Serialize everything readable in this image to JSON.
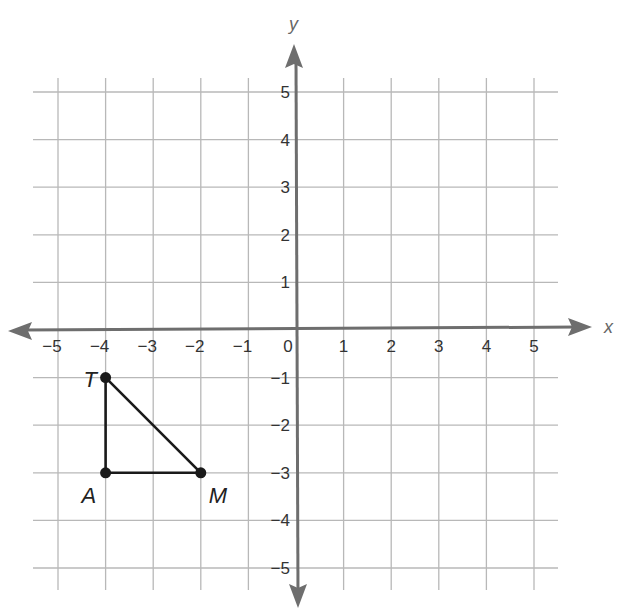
{
  "chart_data": {
    "type": "scatter",
    "title": "",
    "xlabel": "x",
    "ylabel": "y",
    "xlim": [
      -5,
      5
    ],
    "ylim": [
      -5,
      5
    ],
    "grid": true,
    "x_ticks": [
      -5,
      -4,
      -3,
      -2,
      -1,
      0,
      1,
      2,
      3,
      4,
      5
    ],
    "y_ticks": [
      -5,
      -4,
      -3,
      -2,
      -1,
      1,
      2,
      3,
      4,
      5
    ],
    "x_tick_labels": [
      "−5",
      "−4",
      "−3",
      "−2",
      "−1",
      "0",
      "1",
      "2",
      "3",
      "4",
      "5"
    ],
    "y_tick_labels": [
      "−5",
      "−4",
      "−3",
      "−2",
      "−1",
      "1",
      "2",
      "3",
      "4",
      "5"
    ],
    "series": [
      {
        "name": "Triangle TAM",
        "shape": "polygon",
        "points": [
          {
            "label": "T",
            "x": -4,
            "y": -1
          },
          {
            "label": "A",
            "x": -4,
            "y": -3
          },
          {
            "label": "M",
            "x": -2,
            "y": -3
          }
        ]
      }
    ]
  },
  "style": {
    "grid_color": "#b8b8b8",
    "axis_color": "#6e6e6e",
    "shape_color": "#1a1a1a"
  }
}
